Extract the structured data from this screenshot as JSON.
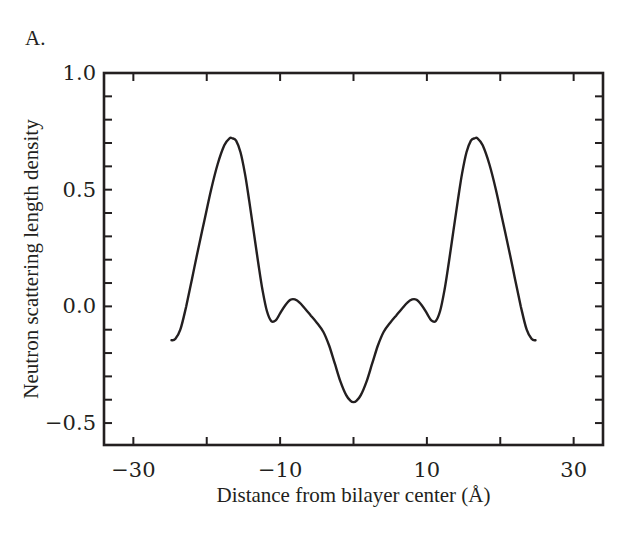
{
  "panel_label": "A.",
  "chart_data": {
    "type": "line",
    "title": "",
    "xlabel": "Distance from bilayer center (Å)",
    "ylabel": "Neutron scattering length density",
    "xlim": [
      -34,
      34
    ],
    "ylim": [
      -0.594,
      1.0
    ],
    "grid": false,
    "legend": null,
    "x_ticks": [
      -30,
      -20,
      -10,
      0,
      10,
      20,
      30
    ],
    "x_tick_labels": [
      "−30",
      "",
      "−10",
      "",
      "10",
      "",
      "30"
    ],
    "y_ticks": [
      -0.5,
      0.0,
      0.5,
      1.0
    ],
    "y_tick_labels": [
      "−0.5",
      "0.0",
      "0.5",
      "1.0"
    ],
    "y_minor_step": 0.1,
    "series": [
      {
        "name": "scattering length density profile",
        "color": "#231f20",
        "x": [
          -24.8,
          -24.3,
          -23.6,
          -22.8,
          -22.0,
          -21.2,
          -20.3,
          -19.4,
          -18.5,
          -17.6,
          -16.9,
          -16.5,
          -16.0,
          -15.4,
          -14.8,
          -14.2,
          -13.6,
          -13.0,
          -12.4,
          -11.8,
          -11.2,
          -10.6,
          -10.0,
          -9.3,
          -8.6,
          -8.0,
          -7.3,
          -6.6,
          -5.8,
          -5.0,
          -4.1,
          -3.3,
          -2.5,
          -1.8,
          -1.0,
          -0.4,
          0.0,
          0.4,
          1.0,
          1.8,
          2.5,
          3.3,
          4.1,
          5.0,
          5.8,
          6.6,
          7.3,
          8.0,
          8.6,
          9.3,
          10.0,
          10.6,
          11.2,
          11.8,
          12.4,
          13.0,
          13.6,
          14.2,
          14.8,
          15.4,
          16.0,
          16.5,
          16.9,
          17.6,
          18.5,
          19.4,
          20.3,
          21.2,
          22.0,
          22.8,
          23.6,
          24.3,
          24.8
        ],
        "y": [
          -0.145,
          -0.14,
          -0.1,
          0.0,
          0.12,
          0.24,
          0.37,
          0.5,
          0.61,
          0.69,
          0.72,
          0.72,
          0.71,
          0.66,
          0.57,
          0.45,
          0.32,
          0.19,
          0.07,
          -0.02,
          -0.063,
          -0.06,
          -0.03,
          0.005,
          0.028,
          0.03,
          0.015,
          -0.01,
          -0.04,
          -0.07,
          -0.11,
          -0.17,
          -0.25,
          -0.32,
          -0.38,
          -0.405,
          -0.41,
          -0.405,
          -0.38,
          -0.32,
          -0.25,
          -0.17,
          -0.11,
          -0.07,
          -0.04,
          -0.01,
          0.015,
          0.03,
          0.028,
          0.005,
          -0.03,
          -0.06,
          -0.063,
          -0.02,
          0.07,
          0.19,
          0.32,
          0.45,
          0.57,
          0.66,
          0.71,
          0.72,
          0.72,
          0.69,
          0.61,
          0.5,
          0.37,
          0.24,
          0.12,
          0.0,
          -0.1,
          -0.14,
          -0.145
        ]
      }
    ]
  }
}
